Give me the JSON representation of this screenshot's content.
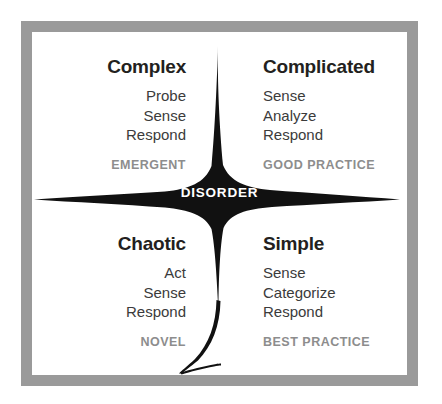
{
  "diagram": {
    "center_label": "DISORDER",
    "colors": {
      "frame": "#9a9a9a",
      "canvas": "#ffffff",
      "shape": "#111111",
      "title_text": "#231f20",
      "step_text": "#3b3b3b",
      "practice_text": "#8d8d8d",
      "center_text": "#ffffff"
    },
    "quadrants": [
      {
        "id": "complex",
        "title": "Complex",
        "steps": [
          "Probe",
          "Sense",
          "Respond"
        ],
        "practice": "EMERGENT",
        "position": "top-left"
      },
      {
        "id": "complicated",
        "title": "Complicated",
        "steps": [
          "Sense",
          "Analyze",
          "Respond"
        ],
        "practice": "GOOD PRACTICE",
        "position": "top-right"
      },
      {
        "id": "chaotic",
        "title": "Chaotic",
        "steps": [
          "Act",
          "Sense",
          "Respond"
        ],
        "practice": "NOVEL",
        "position": "bottom-left"
      },
      {
        "id": "simple",
        "title": "Simple",
        "steps": [
          "Sense",
          "Categorize",
          "Respond"
        ],
        "practice": "BEST PRACTICE",
        "position": "bottom-right"
      }
    ]
  }
}
